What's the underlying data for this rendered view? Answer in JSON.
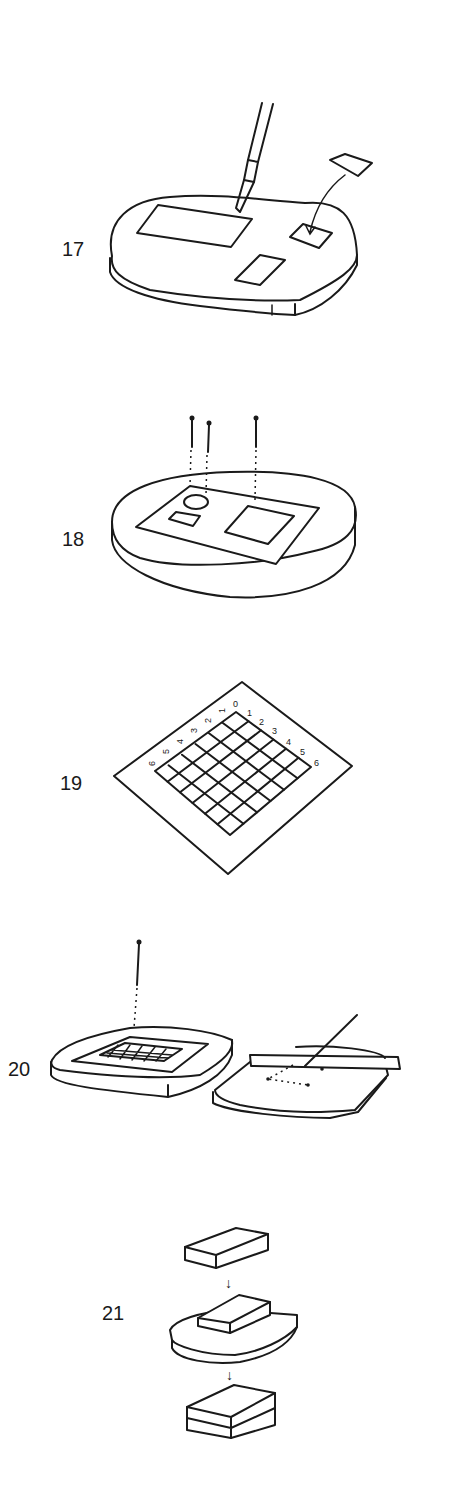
{
  "steps": [
    {
      "number": "17",
      "description": "Knife cutting a rectangular sample from a sheet on a soft base; a small square piece being placed onto the base (arrow)"
    },
    {
      "number": "18",
      "description": "Sheet with circle, small rectangle and square cutouts laid on an oval base, pinned with three pins (dashed lines)"
    },
    {
      "number": "19",
      "description": "Grid sheet 6x6 with edge numbering"
    },
    {
      "number": "20",
      "description": "Grid pinned on a base; second base with ruler and needle marking dotted points"
    },
    {
      "number": "21",
      "description": "Block placed onto a curved base, then stacked into a two-layer block (arrows)"
    }
  ],
  "grid": {
    "top_right_numbers": [
      "0",
      "1",
      "2",
      "3",
      "4",
      "5",
      "6"
    ],
    "top_left_numbers": [
      "1",
      "2",
      "3",
      "4",
      "5",
      "6"
    ]
  },
  "arrow_glyph": "↓",
  "colors": {
    "ink": "#1a1a1a",
    "background": "#ffffff"
  }
}
